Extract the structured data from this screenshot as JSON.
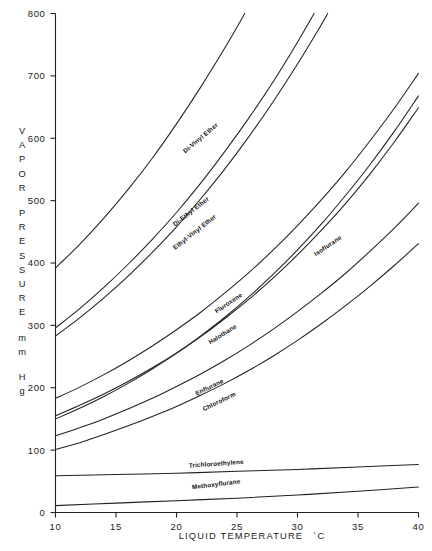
{
  "chart_data": {
    "type": "line",
    "title": "",
    "xlabel": "LIQUID TEMPERATURE °C",
    "ylabel": "VAPOR PRESSURE mm Hg",
    "xlabel_main": "LIQUID   TEMPERATURE",
    "xlabel_unit_deg": "°",
    "xlabel_unit_c": "C",
    "ylabel_lines": [
      "VAPOR",
      "PRESSURE",
      "mm",
      "Hg"
    ],
    "xlim": [
      10,
      40
    ],
    "ylim": [
      0,
      800
    ],
    "xticks": [
      10,
      15,
      20,
      25,
      30,
      35,
      40
    ],
    "xticklabels": [
      "10",
      "15",
      "20",
      "25",
      "30",
      "35",
      "40"
    ],
    "yticks": [
      0,
      100,
      200,
      300,
      400,
      500,
      600,
      700,
      800
    ],
    "yticklabels": [
      "0",
      "100",
      "200",
      "300",
      "400",
      "500",
      "600",
      "700",
      "800"
    ],
    "grid": false,
    "legend_position": "inline-curve-labels",
    "series": [
      {
        "name": "Di-Vinyl Ether",
        "label": "Di-Vinyl  Ether",
        "label_x": 22.1,
        "label_y": 598,
        "label_angle": -40,
        "x": [
          10,
          12,
          14,
          16,
          18,
          20,
          22,
          24,
          26,
          28,
          30,
          31.2
        ],
        "y": [
          392,
          430,
          472,
          518,
          568,
          623,
          682,
          745,
          812,
          884,
          961,
          1010
        ]
      },
      {
        "name": "Di-Ethyl Ether",
        "label": "Di-Ethyl  Ether",
        "label_x": 21.3,
        "label_y": 480,
        "label_angle": -38,
        "x": [
          10,
          12,
          14,
          16,
          18,
          20,
          22,
          24,
          26,
          28,
          30,
          32,
          34,
          35.2
        ],
        "y": [
          296,
          327,
          361,
          398,
          438,
          481,
          528,
          579,
          633,
          691,
          754,
          821,
          893,
          935
        ]
      },
      {
        "name": "Ethyl-Vinyl Ether",
        "label": "Ethyl-Vinyl  Ether",
        "label_x": 21.6,
        "label_y": 447,
        "label_angle": -38,
        "x": [
          10,
          12,
          14,
          16,
          18,
          20,
          22,
          24,
          26,
          28,
          30,
          32,
          34,
          36.3
        ],
        "y": [
          283,
          312,
          344,
          379,
          417,
          458,
          503,
          551,
          603,
          659,
          719,
          783,
          852,
          932
        ]
      },
      {
        "name": "Fluroxene",
        "label": "Fluroxene",
        "label_x": 24.4,
        "label_y": 333,
        "label_angle": -34,
        "x": [
          10,
          12,
          14,
          16,
          18,
          20,
          22,
          24,
          26,
          28,
          30,
          32,
          34,
          36,
          38,
          40
        ],
        "y": [
          183,
          201,
          221,
          243,
          267,
          293,
          321,
          352,
          385,
          421,
          460,
          502,
          547,
          596,
          648,
          704
        ]
      },
      {
        "name": "Halothane",
        "label": "Halothane",
        "label_x": 23.9,
        "label_y": 283,
        "label_angle": -32,
        "x": [
          10,
          12,
          14,
          16,
          18,
          20,
          22,
          24,
          26,
          28,
          30,
          32,
          34,
          36,
          38,
          40
        ],
        "y": [
          155,
          172,
          190,
          210,
          232,
          256,
          282,
          311,
          342,
          376,
          413,
          453,
          496,
          543,
          594,
          649
        ]
      },
      {
        "name": "Isoflurane",
        "label": "Isoflurane",
        "label_x": 32.6,
        "label_y": 425,
        "label_angle": -34,
        "x": [
          10,
          12,
          14,
          16,
          18,
          20,
          22,
          24,
          26,
          28,
          30,
          32,
          34,
          36,
          38,
          40
        ],
        "y": [
          150,
          167,
          186,
          207,
          230,
          255,
          283,
          313,
          346,
          382,
          421,
          463,
          509,
          558,
          611,
          668
        ]
      },
      {
        "name": "Enflurane",
        "label": "Enflurane",
        "label_x": 22.8,
        "label_y": 198,
        "label_angle": -26,
        "x": [
          10,
          12,
          14,
          16,
          18,
          20,
          22,
          24,
          26,
          28,
          30,
          32,
          34,
          36,
          38,
          40
        ],
        "y": [
          123,
          136,
          150,
          166,
          183,
          202,
          222,
          244,
          268,
          294,
          322,
          352,
          384,
          419,
          456,
          496
        ]
      },
      {
        "name": "Chloroform",
        "label": "Chloroform",
        "label_x": 23.6,
        "label_y": 175,
        "label_angle": -26,
        "x": [
          10,
          12,
          14,
          16,
          18,
          20,
          22,
          24,
          26,
          28,
          30,
          32,
          34,
          36,
          38,
          40
        ],
        "y": [
          101,
          112,
          125,
          139,
          154,
          170,
          188,
          207,
          228,
          251,
          276,
          303,
          332,
          363,
          396,
          431
        ]
      },
      {
        "name": "Trichloroethylene",
        "label": "Trichloroethylene",
        "label_x": 23.3,
        "label_y": 75,
        "label_angle": -4,
        "x": [
          10,
          15,
          20,
          25,
          30,
          35,
          40
        ],
        "y": [
          59,
          61,
          63,
          66,
          69,
          73,
          77
        ]
      },
      {
        "name": "Methoxyflurane",
        "label": "Methoxyflurane",
        "label_x": 23.3,
        "label_y": 42,
        "label_angle": -7,
        "x": [
          10,
          15,
          20,
          25,
          30,
          35,
          40
        ],
        "y": [
          11,
          15,
          19,
          23,
          28,
          34,
          41
        ]
      }
    ]
  }
}
